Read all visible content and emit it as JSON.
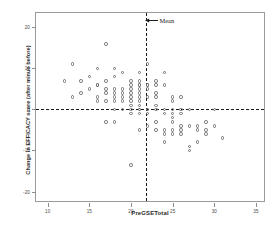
{
  "chart_data": {
    "type": "scatter",
    "title": "",
    "xlabel": "PreGSETotal",
    "ylabel": "Change in EFFICACY score (after minus before)",
    "xlim": [
      8.6,
      36.2
    ],
    "ylim": [
      -22.8,
      23.5
    ],
    "xticks": [
      10,
      15,
      20,
      25,
      30,
      35
    ],
    "xticklabels": [
      "10",
      "15",
      "20",
      "25",
      "30",
      "35"
    ],
    "yticks": [
      20,
      10,
      0,
      -10,
      -20
    ],
    "yticklabels": [
      "20",
      "10",
      "0",
      "-10",
      "-20"
    ],
    "grid": false,
    "legend": null,
    "marker": "open-circle",
    "marker_color": "#6e6e6e",
    "reference_lines": [
      {
        "orientation": "horizontal",
        "value": 0,
        "style": "dashed",
        "color": "#1b1b1b"
      },
      {
        "orientation": "vertical",
        "value": 21.75,
        "style": "dashed",
        "color": "#1b1b1b",
        "label": "Mean"
      }
    ],
    "annotations": [
      {
        "text": "Mean",
        "x": 21.75,
        "y": 21.2,
        "arrow": "left"
      }
    ],
    "points": [
      [
        12,
        7
      ],
      [
        13,
        11
      ],
      [
        13,
        3
      ],
      [
        14,
        7
      ],
      [
        14,
        4
      ],
      [
        15,
        8
      ],
      [
        15,
        5
      ],
      [
        16,
        10
      ],
      [
        16,
        6
      ],
      [
        16,
        6
      ],
      [
        16,
        2
      ],
      [
        16,
        3
      ],
      [
        17,
        16
      ],
      [
        17,
        7
      ],
      [
        17,
        5
      ],
      [
        17,
        4
      ],
      [
        17,
        2
      ],
      [
        17,
        -3
      ],
      [
        18,
        10
      ],
      [
        18,
        8
      ],
      [
        18,
        5
      ],
      [
        18,
        4
      ],
      [
        18,
        3
      ],
      [
        18,
        2
      ],
      [
        18,
        0
      ],
      [
        18,
        -3
      ],
      [
        19,
        9
      ],
      [
        19,
        5
      ],
      [
        19,
        4
      ],
      [
        19,
        3
      ],
      [
        19,
        2
      ],
      [
        19,
        0
      ],
      [
        20,
        7
      ],
      [
        20,
        6
      ],
      [
        20,
        5
      ],
      [
        20,
        4
      ],
      [
        20,
        3
      ],
      [
        20,
        2
      ],
      [
        20,
        1
      ],
      [
        20,
        0
      ],
      [
        20,
        -1
      ],
      [
        20,
        -13.5
      ],
      [
        21,
        9
      ],
      [
        21,
        7
      ],
      [
        21,
        6
      ],
      [
        21,
        6
      ],
      [
        21,
        5
      ],
      [
        21,
        4
      ],
      [
        21,
        3
      ],
      [
        21,
        2
      ],
      [
        21,
        1
      ],
      [
        21,
        0
      ],
      [
        21,
        0
      ],
      [
        21,
        -1
      ],
      [
        21,
        -5
      ],
      [
        22,
        11
      ],
      [
        22,
        6
      ],
      [
        22,
        6
      ],
      [
        22,
        5
      ],
      [
        22,
        3
      ],
      [
        22,
        0
      ],
      [
        22,
        0
      ],
      [
        22,
        -1
      ],
      [
        22,
        -4
      ],
      [
        23,
        7
      ],
      [
        23,
        6
      ],
      [
        23,
        4
      ],
      [
        23,
        3
      ],
      [
        23,
        1
      ],
      [
        23,
        0
      ],
      [
        23,
        -3
      ],
      [
        23,
        -5
      ],
      [
        24,
        9
      ],
      [
        24,
        6
      ],
      [
        24,
        0
      ],
      [
        24,
        -1
      ],
      [
        24,
        -5
      ],
      [
        24,
        -6
      ],
      [
        24,
        -8
      ],
      [
        25,
        3
      ],
      [
        25,
        2
      ],
      [
        25,
        0
      ],
      [
        25,
        -1
      ],
      [
        25,
        -2
      ],
      [
        25,
        -3
      ],
      [
        25,
        -5
      ],
      [
        25,
        -6
      ],
      [
        26,
        3
      ],
      [
        26,
        0
      ],
      [
        26,
        -1
      ],
      [
        26,
        -4
      ],
      [
        26,
        -5
      ],
      [
        26,
        -6
      ],
      [
        27,
        0
      ],
      [
        27,
        -4
      ],
      [
        27,
        -9
      ],
      [
        27,
        -10
      ],
      [
        28,
        -4
      ],
      [
        28,
        -5
      ],
      [
        28,
        -8
      ],
      [
        29,
        -3
      ],
      [
        29,
        -5
      ],
      [
        29,
        -6
      ],
      [
        30,
        0
      ],
      [
        30,
        -4
      ],
      [
        31,
        -7
      ]
    ]
  }
}
